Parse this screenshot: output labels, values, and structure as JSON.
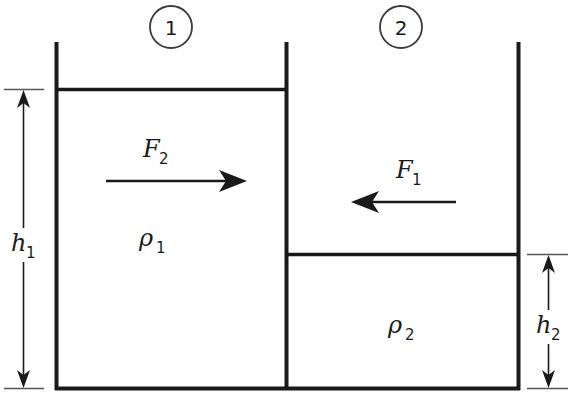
{
  "figure": {
    "background_color": "#ffffff",
    "line_color": "#1a1a1a",
    "width": 570,
    "height": 402
  },
  "compartments": [
    {
      "id": "compartment-1",
      "badge_label": "1",
      "density_symbol": "ρ",
      "density_subscript": "1",
      "density_label": "ρ₁",
      "fluid_height_label": "h₁"
    },
    {
      "id": "compartment-2",
      "badge_label": "2",
      "density_symbol": "ρ",
      "density_subscript": "2",
      "density_label": "ρ₂",
      "fluid_height_label": "h₂"
    }
  ],
  "forces": [
    {
      "id": "force-F2",
      "symbol": "F",
      "subscript": "2",
      "label": "F₂",
      "direction": "right",
      "located_in": "compartment-1"
    },
    {
      "id": "force-F1",
      "symbol": "F",
      "subscript": "1",
      "label": "F₁",
      "direction": "left",
      "located_in": "compartment-2"
    }
  ],
  "dimensions": [
    {
      "id": "dimension-h1",
      "symbol": "h",
      "subscript": "1",
      "label": "h₁",
      "side": "left",
      "orientation": "vertical",
      "arrow_ends": "both"
    },
    {
      "id": "dimension-h2",
      "symbol": "h",
      "subscript": "2",
      "label": "h₂",
      "side": "right",
      "orientation": "vertical",
      "arrow_ends": "both"
    }
  ]
}
